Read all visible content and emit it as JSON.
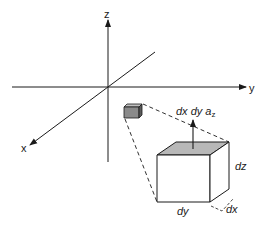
{
  "axes": {
    "x_label": "x",
    "y_label": "y",
    "z_label": "z"
  },
  "volume_element": {
    "flux_label_main": "dx dy a",
    "flux_label_sub": "z",
    "edge_dz": "dz",
    "edge_dy": "dy",
    "edge_dx": "dx"
  },
  "colors": {
    "line": "#1a1a1a",
    "shade_top": "#b8b8b8",
    "shade_small_front": "#8a8a8a",
    "shade_small_side": "#5a5a5a",
    "shade_small_top": "#c0c0c0"
  }
}
